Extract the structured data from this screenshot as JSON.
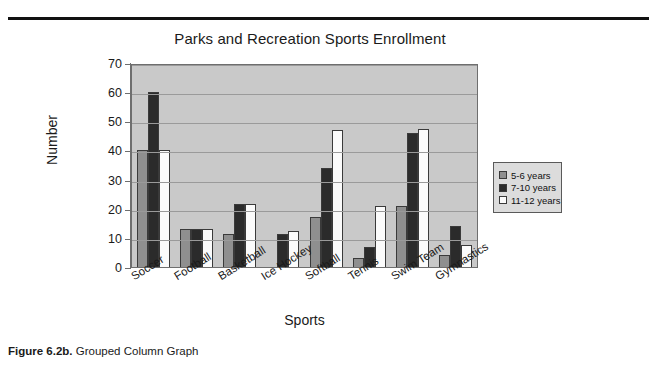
{
  "figure": {
    "caption_label": "Figure 6.2b.",
    "caption_text": " Grouped Column Graph"
  },
  "chart_data": {
    "type": "bar",
    "title": "Parks and Recreation Sports Enrollment",
    "xlabel": "Sports",
    "ylabel": "Number",
    "ylim": [
      0,
      70
    ],
    "yticks": [
      0,
      10,
      20,
      30,
      40,
      50,
      60,
      70
    ],
    "grid": true,
    "legend_position": "right",
    "categories": [
      "Soccer",
      "Football",
      "Basketball",
      "Ice Hockey",
      "Softball",
      "Tennis",
      "Swim Team",
      "Gymnastics"
    ],
    "series": [
      {
        "name": "5-6 years",
        "color": "#8f8f8f",
        "values": [
          40,
          13,
          11.5,
          0,
          17,
          3,
          21,
          4
        ]
      },
      {
        "name": "7-10 years",
        "color": "#2b2b2b",
        "values": [
          60,
          13,
          21.5,
          11.5,
          34,
          7,
          46,
          14
        ]
      },
      {
        "name": "11-12 years",
        "color": "#fbfbfb",
        "values": [
          40,
          13,
          21.5,
          12.5,
          47,
          21,
          47.5,
          7.5
        ]
      }
    ]
  },
  "colors": {
    "plot_background": "#c9c9c9",
    "gridline": "#9a9a9a",
    "axis": "#6e6e6e",
    "legend_background": "#dcdcdc"
  }
}
